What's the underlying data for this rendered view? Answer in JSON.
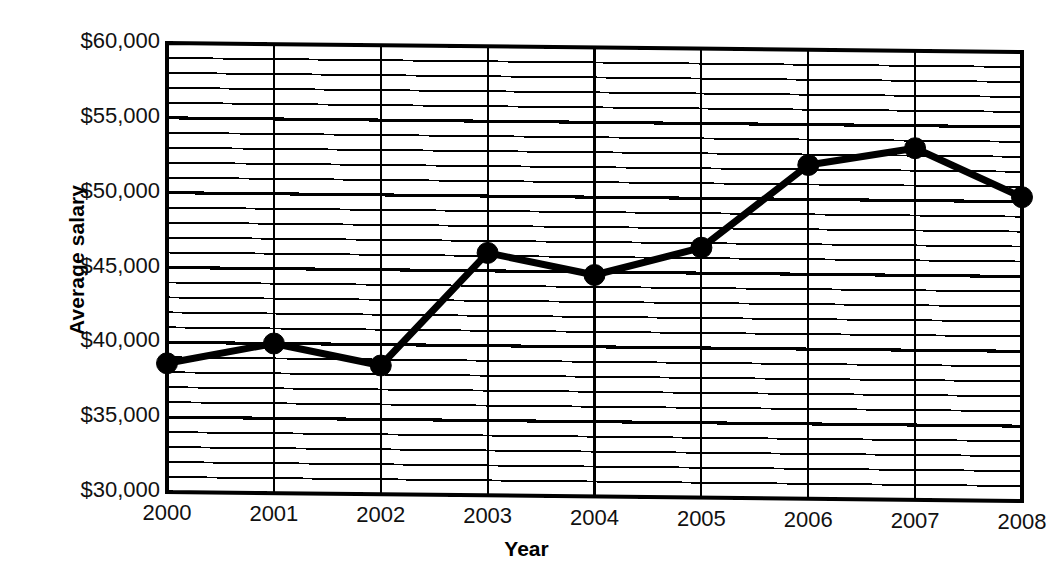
{
  "chart_data": {
    "type": "line",
    "title": "",
    "xlabel": "Year",
    "ylabel": "Average salary",
    "categories": [
      "2000",
      "2001",
      "2002",
      "2003",
      "2004",
      "2005",
      "2006",
      "2007",
      "2008"
    ],
    "x": [
      2000,
      2001,
      2002,
      2003,
      2004,
      2005,
      2006,
      2007,
      2008
    ],
    "values": [
      38600,
      40000,
      38600,
      46200,
      44800,
      46700,
      52300,
      53500,
      50300
    ],
    "series": [
      {
        "name": "Average salary",
        "values": [
          38600,
          40000,
          38600,
          46200,
          44800,
          46700,
          52300,
          53500,
          50300
        ]
      }
    ],
    "ylim": [
      30000,
      60000
    ],
    "xlim": [
      2000,
      2008
    ],
    "y_major_ticks": [
      30000,
      35000,
      40000,
      45000,
      50000,
      55000,
      60000
    ],
    "y_tick_labels": [
      "$30,000",
      "$35,000",
      "$40,000",
      "$45,000",
      "$50,000",
      "$55,000",
      "$60,000"
    ],
    "y_minor_step": 1000,
    "grid": true,
    "grid_major_axis": "y",
    "grid_minor_axis": "y",
    "vertical_gridlines": true,
    "legend": null,
    "legend_position": "none",
    "marker": "filled-circle",
    "line_color": "#000000",
    "marker_color": "#000000",
    "grid_color": "#000000",
    "background_color": "#ffffff"
  },
  "axes": {
    "y_title": "Average salary",
    "x_title": "Year"
  }
}
